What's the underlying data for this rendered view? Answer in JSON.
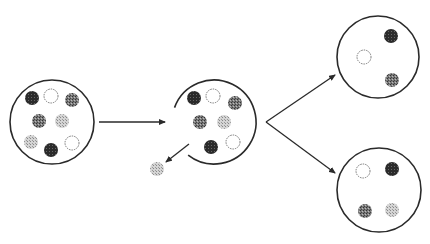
{
  "diagram": {
    "colors": {
      "background": "#ffffff",
      "stroke": "#2a2a2a",
      "dark": "#2b2b2b",
      "medium": "#6e6e6e",
      "light": "#bdbdbd",
      "open_fill": "#ffffff"
    },
    "containers": [
      {
        "id": "initial-set",
        "cx": 52,
        "cy": 122,
        "r": 42,
        "gap": false,
        "particles": [
          {
            "type": "dark",
            "x": 32,
            "y": 98
          },
          {
            "type": "open",
            "x": 51,
            "y": 96
          },
          {
            "type": "medium",
            "x": 72,
            "y": 100
          },
          {
            "type": "medium",
            "x": 39,
            "y": 121
          },
          {
            "type": "light",
            "x": 62,
            "y": 121
          },
          {
            "type": "light",
            "x": 31,
            "y": 142
          },
          {
            "type": "dark",
            "x": 51,
            "y": 150
          },
          {
            "type": "open",
            "x": 72,
            "y": 143
          }
        ]
      },
      {
        "id": "after-ejection-set",
        "cx": 214,
        "cy": 122,
        "r": 42,
        "gap": true,
        "gap_start_deg": 128,
        "gap_end_deg": 200,
        "particles": [
          {
            "type": "dark",
            "x": 194,
            "y": 98
          },
          {
            "type": "open",
            "x": 213,
            "y": 96
          },
          {
            "type": "medium",
            "x": 235,
            "y": 103
          },
          {
            "type": "medium",
            "x": 200,
            "y": 122
          },
          {
            "type": "light",
            "x": 224,
            "y": 122
          },
          {
            "type": "dark",
            "x": 211,
            "y": 147
          },
          {
            "type": "open",
            "x": 233,
            "y": 142
          }
        ]
      },
      {
        "id": "subset-top",
        "cx": 378,
        "cy": 57,
        "r": 41,
        "gap": false,
        "particles": [
          {
            "type": "dark",
            "x": 391,
            "y": 36
          },
          {
            "type": "open",
            "x": 364,
            "y": 57
          },
          {
            "type": "medium",
            "x": 392,
            "y": 80
          }
        ]
      },
      {
        "id": "subset-bottom",
        "cx": 379,
        "cy": 190,
        "r": 42,
        "gap": false,
        "particles": [
          {
            "type": "open",
            "x": 363,
            "y": 171
          },
          {
            "type": "dark",
            "x": 392,
            "y": 169
          },
          {
            "type": "medium",
            "x": 365,
            "y": 211
          },
          {
            "type": "light",
            "x": 392,
            "y": 210
          }
        ]
      }
    ],
    "ejected_particle": {
      "type": "light",
      "x": 157,
      "y": 169
    },
    "particle_radius": 7,
    "arrows": [
      {
        "id": "arrow-initial-to-second",
        "x1": 99,
        "y1": 122,
        "x2": 165,
        "y2": 122,
        "head": true
      },
      {
        "id": "arrow-ejection",
        "x1": 189,
        "y1": 144,
        "x2": 166,
        "y2": 162,
        "head": true
      },
      {
        "id": "arrow-split-top",
        "x1": 266,
        "y1": 122,
        "x2": 335,
        "y2": 75,
        "head": true
      },
      {
        "id": "arrow-split-bottom",
        "x1": 266,
        "y1": 122,
        "x2": 335,
        "y2": 173,
        "head": true
      }
    ]
  }
}
